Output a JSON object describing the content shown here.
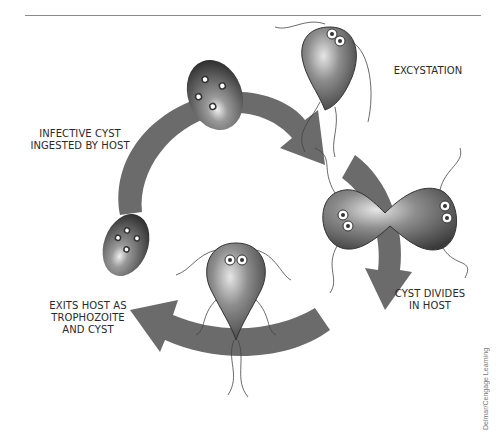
{
  "diagram": {
    "type": "life-cycle",
    "arrow_color": "#6b6b6b",
    "stages": [
      {
        "id": "excystation",
        "lines": [
          "EXCYSTATION"
        ]
      },
      {
        "id": "cyst-divides",
        "lines": [
          "CYST DIVIDES",
          "IN HOST"
        ]
      },
      {
        "id": "exits-host",
        "lines": [
          "EXITS HOST AS",
          "TROPHOZOITE",
          "AND CYST"
        ]
      },
      {
        "id": "infective-cyst",
        "lines": [
          "INFECTIVE CYST",
          "INGESTED BY HOST"
        ]
      }
    ]
  },
  "credit": "Delmar/Cengage Learning"
}
